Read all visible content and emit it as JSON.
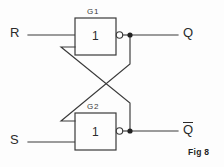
{
  "figure": {
    "caption": "Fig 8",
    "title_type": "logic-circuit-schematic"
  },
  "inputs": [
    {
      "id": "R",
      "label": "R",
      "x": 14,
      "y": 28
    },
    {
      "id": "S",
      "label": "S",
      "x": 14,
      "y": 135
    }
  ],
  "outputs": [
    {
      "id": "Q",
      "label": "Q",
      "overbar": false,
      "x": 183,
      "y": 28
    },
    {
      "id": "Qbar",
      "label": "Q",
      "overbar": true,
      "x": 183,
      "y": 123
    }
  ],
  "gates": [
    {
      "id": "G1",
      "name": "G1",
      "symbol": "1",
      "inverting_output": true,
      "box": {
        "x": 75,
        "y": 18,
        "w": 41,
        "h": 37
      }
    },
    {
      "id": "G2",
      "name": "G2",
      "symbol": "1",
      "inverting_output": true,
      "box": {
        "x": 75,
        "y": 113,
        "w": 41,
        "h": 37
      }
    }
  ],
  "nodes": {
    "q_junction": {
      "x": 130,
      "y": 35
    },
    "qbar_junction": {
      "x": 130,
      "y": 131
    }
  },
  "colors": {
    "wire": "#3a3a3a",
    "text": "#2b2b2b",
    "background": "#fdfdfd",
    "junction": "#222222"
  }
}
